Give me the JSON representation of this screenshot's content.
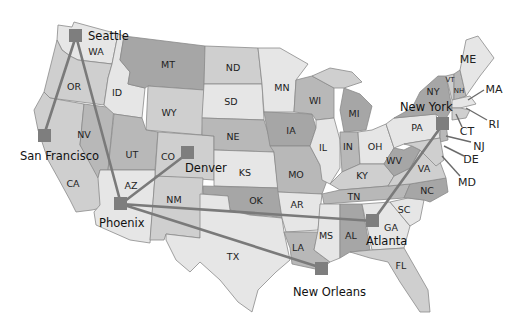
{
  "map": {
    "type": "US airline route map (grayscale)",
    "states": [
      {
        "code": "WA",
        "x": 96,
        "y": 52
      },
      {
        "code": "OR",
        "x": 72,
        "y": 87
      },
      {
        "code": "CA",
        "x": 74,
        "y": 184
      },
      {
        "code": "ID",
        "x": 117,
        "y": 93
      },
      {
        "code": "NV",
        "x": 83,
        "y": 135
      },
      {
        "code": "UT",
        "x": 131,
        "y": 155
      },
      {
        "code": "AZ",
        "x": 131,
        "y": 186
      },
      {
        "code": "MT",
        "x": 168,
        "y": 65
      },
      {
        "code": "WY",
        "x": 168,
        "y": 113
      },
      {
        "code": "CO",
        "x": 170,
        "y": 157
      },
      {
        "code": "NM",
        "x": 174,
        "y": 200
      },
      {
        "code": "ND",
        "x": 233,
        "y": 68
      },
      {
        "code": "SD",
        "x": 231,
        "y": 102
      },
      {
        "code": "NE",
        "x": 233,
        "y": 137
      },
      {
        "code": "KS",
        "x": 245,
        "y": 173
      },
      {
        "code": "OK",
        "x": 256,
        "y": 201
      },
      {
        "code": "TX",
        "x": 233,
        "y": 257
      },
      {
        "code": "MN",
        "x": 282,
        "y": 88
      },
      {
        "code": "IA",
        "x": 291,
        "y": 131
      },
      {
        "code": "MO",
        "x": 296,
        "y": 175
      },
      {
        "code": "AR",
        "x": 297,
        "y": 205
      },
      {
        "code": "LA",
        "x": 298,
        "y": 248
      },
      {
        "code": "WI",
        "x": 315,
        "y": 101
      },
      {
        "code": "IL",
        "x": 323,
        "y": 148
      },
      {
        "code": "MS",
        "x": 326,
        "y": 236
      },
      {
        "code": "MI",
        "x": 354,
        "y": 114
      },
      {
        "code": "IN",
        "x": 347,
        "y": 147
      },
      {
        "code": "KY",
        "x": 362,
        "y": 176
      },
      {
        "code": "TN",
        "x": 354,
        "y": 197
      },
      {
        "code": "AL",
        "x": 351,
        "y": 236
      },
      {
        "code": "OH",
        "x": 375,
        "y": 147
      },
      {
        "code": "GA",
        "x": 392,
        "y": 228
      },
      {
        "code": "FL",
        "x": 401,
        "y": 266
      },
      {
        "code": "WV",
        "x": 394,
        "y": 161
      },
      {
        "code": "VA",
        "x": 424,
        "y": 169
      },
      {
        "code": "NC",
        "x": 427,
        "y": 191
      },
      {
        "code": "SC",
        "x": 404,
        "y": 210
      },
      {
        "code": "PA",
        "x": 417,
        "y": 128
      },
      {
        "code": "NY",
        "x": 433,
        "y": 92
      },
      {
        "code": "VT",
        "x": 450,
        "y": 79
      },
      {
        "code": "NH",
        "x": 458,
        "y": 90
      },
      {
        "code": "ME",
        "x": 468,
        "y": 60
      }
    ],
    "callout_states": [
      {
        "code": "MA",
        "x": 492,
        "y": 90
      },
      {
        "code": "RI",
        "x": 493,
        "y": 124
      },
      {
        "code": "CT",
        "x": 467,
        "y": 131
      },
      {
        "code": "NJ",
        "x": 478,
        "y": 146
      },
      {
        "code": "DE",
        "x": 470,
        "y": 159
      },
      {
        "code": "MD",
        "x": 466,
        "y": 182
      }
    ],
    "cities": [
      {
        "name": "Seattle",
        "x": 76,
        "y": 36
      },
      {
        "name": "San Francisco",
        "x": 44,
        "y": 135
      },
      {
        "name": "Denver",
        "x": 188,
        "y": 153
      },
      {
        "name": "Phoenix",
        "x": 121,
        "y": 204
      },
      {
        "name": "New Orleans",
        "x": 322,
        "y": 268
      },
      {
        "name": "Atlanta",
        "x": 373,
        "y": 221
      },
      {
        "name": "New York",
        "x": 443,
        "y": 124
      }
    ],
    "routes": [
      [
        "Seattle",
        "San Francisco"
      ],
      [
        "Seattle",
        "Phoenix"
      ],
      [
        "Phoenix",
        "Denver"
      ],
      [
        "Phoenix",
        "Atlanta"
      ],
      [
        "Phoenix",
        "New Orleans"
      ],
      [
        "Atlanta",
        "New York"
      ]
    ],
    "colors": {
      "light": "#e6e6e6",
      "mid": "#cfcfcf",
      "dark": "#b8b8b8",
      "darker": "#a6a6a6",
      "route": "#7a7a7a",
      "hub": "#7e7e7e",
      "border": "#8a8a8a"
    }
  }
}
